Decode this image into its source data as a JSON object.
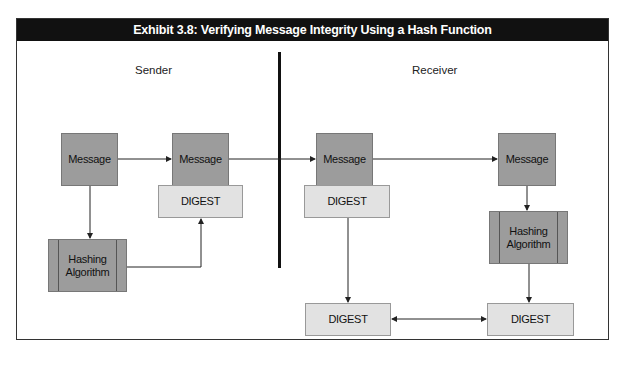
{
  "exhibit": {
    "title": "Exhibit 3.8:  Verifying Message Integrity Using a Hash Function"
  },
  "lanes": {
    "sender_label": "Sender",
    "receiver_label": "Receiver"
  },
  "sender": {
    "message_label": "Message",
    "hashing_label_line1": "Hashing",
    "hashing_label_line2": "Algorithm",
    "packet_message_label": "Message",
    "packet_digest_label": "DIGEST"
  },
  "receiver": {
    "packet_message_label": "Message",
    "packet_digest_label": "DIGEST",
    "message_label": "Message",
    "hashing_label_line1": "Hashing",
    "hashing_label_line2": "Algorithm",
    "received_digest_label": "DIGEST",
    "computed_digest_label": "DIGEST"
  },
  "colors": {
    "title_bg": "#111111",
    "message_fill": "#9c9c9c",
    "digest_fill": "#e2e2e2"
  }
}
